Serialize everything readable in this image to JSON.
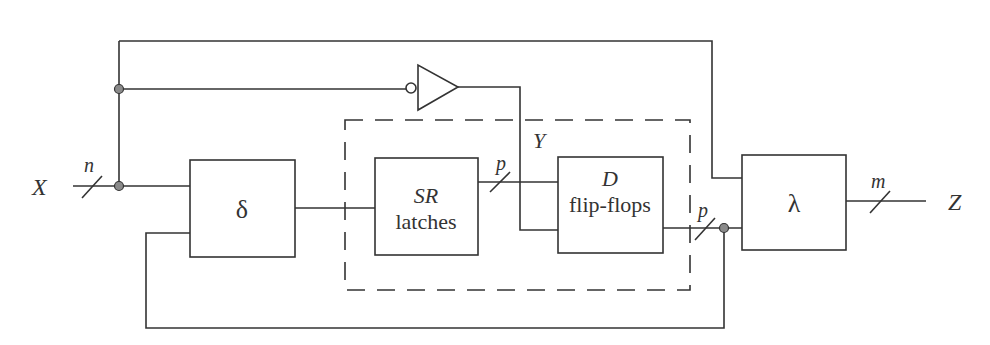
{
  "diagram": {
    "type": "sequential circuit block diagram",
    "inputs": {
      "label": "X",
      "width_label": "n"
    },
    "outputs": {
      "label": "Z",
      "width_label": "m"
    },
    "blocks": {
      "delta": {
        "label": "δ"
      },
      "sr_latches": {
        "line1": "SR",
        "line2": "latches"
      },
      "d_flipflops": {
        "line1": "D",
        "line2": "flip-flops"
      },
      "lambda": {
        "label": "λ"
      }
    },
    "signals": {
      "latch_bus_width": "p",
      "state_bus_width": "p",
      "clock_signal": "Y"
    },
    "colors": {
      "line": "#333333",
      "junction": "#8a8a8a",
      "background": "#ffffff"
    }
  }
}
